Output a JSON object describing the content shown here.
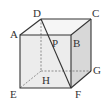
{
  "diagram": {
    "type": "cube",
    "labels": {
      "A": "A",
      "B": "B",
      "C": "C",
      "D": "D",
      "E": "E",
      "F": "F",
      "G": "G",
      "H": "H",
      "P": "P"
    },
    "colors": {
      "edge": "#333333",
      "hidden_edge": "#777777",
      "front_face": "#ececec",
      "right_face": "#d8d8d8",
      "top_face": "#f6f6f6"
    },
    "segments": [
      "DF (diagonal through P)"
    ]
  }
}
